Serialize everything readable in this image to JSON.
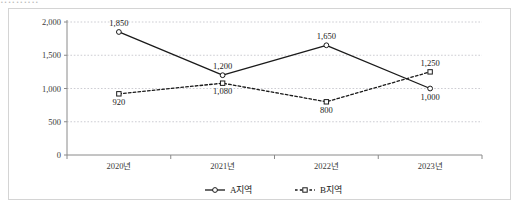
{
  "clipped_header_text": "‥‥‥‥‥",
  "chart_data": {
    "type": "line",
    "title": "",
    "xlabel": "",
    "ylabel": "",
    "categories": [
      "2020년",
      "2021년",
      "2022년",
      "2023년"
    ],
    "ylim": [
      0,
      2000
    ],
    "yticks": [
      0,
      500,
      1000,
      1500,
      2000
    ],
    "ytick_labels": [
      "0",
      "500",
      "1,000",
      "1,500",
      "2,000"
    ],
    "grid": true,
    "legend_position": "bottom-center",
    "series": [
      {
        "name": "A지역",
        "values": [
          1850,
          1200,
          1650,
          1000
        ],
        "labels": [
          "1,850",
          "1,200",
          "1,650",
          "1,000"
        ],
        "line_style": "solid",
        "marker": "circle",
        "color": "#1a1a1a"
      },
      {
        "name": "B지역",
        "values": [
          920,
          1080,
          800,
          1250
        ],
        "labels": [
          "920",
          "1,080",
          "800",
          "1,250"
        ],
        "line_style": "dashed",
        "marker": "square",
        "color": "#1a1a1a"
      }
    ]
  },
  "legend": {
    "items": [
      {
        "label": "A지역"
      },
      {
        "label": "B지역"
      }
    ]
  },
  "colors": {
    "border": "#d4d4d4",
    "grid": "#c0c0c8",
    "axis": "#8a8a8a",
    "ink": "#1a1a1a"
  }
}
